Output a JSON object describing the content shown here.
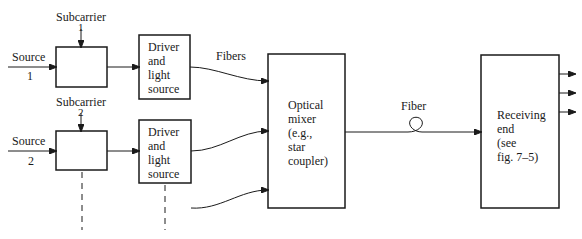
{
  "labels": {
    "subcarrier_1": "Subcarrier",
    "subcarrier_1_num": "1",
    "subcarrier_2": "Subcarrier",
    "subcarrier_2_num": "2",
    "source_1": "Source",
    "source_1_num": "1",
    "source_2": "Source",
    "source_2_num": "2",
    "fibers": "Fibers",
    "fiber": "Fiber"
  },
  "blocks": {
    "modulator_1": "",
    "modulator_2": "",
    "driver_1": [
      "Driver",
      "and",
      "light",
      "source"
    ],
    "driver_2": [
      "Driver",
      "and",
      "light",
      "source"
    ],
    "optical_mixer": [
      "Optical",
      "mixer",
      "(e.g.,",
      "star",
      "coupler)"
    ],
    "receiving_end": [
      "Receiving",
      "end",
      "(see",
      "fig. 7–5)"
    ]
  },
  "colors": {
    "line": "#1a1a1a",
    "background": "#ffffff"
  }
}
